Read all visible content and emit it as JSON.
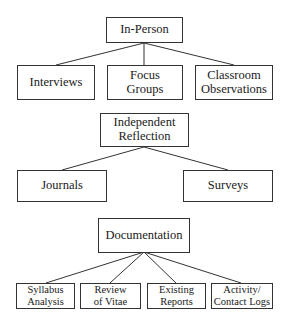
{
  "diagram": {
    "groups": [
      {
        "root": {
          "label": "In-Person"
        },
        "children": [
          {
            "label": "Interviews"
          },
          {
            "label": "Focus\nGroups"
          },
          {
            "label": "Classroom\nObservations"
          }
        ]
      },
      {
        "root": {
          "label": "Independent\nReflection"
        },
        "children": [
          {
            "label": "Journals"
          },
          {
            "label": "Surveys"
          }
        ]
      },
      {
        "root": {
          "label": "Documentation"
        },
        "children": [
          {
            "label": "Syllabus\nAnalysis"
          },
          {
            "label": "Review\nof Vitae"
          },
          {
            "label": "Existing\nReports"
          },
          {
            "label": "Activity/\nContact Logs"
          }
        ]
      }
    ],
    "colors": {
      "stroke": "#333333",
      "background": "#ffffff"
    }
  }
}
